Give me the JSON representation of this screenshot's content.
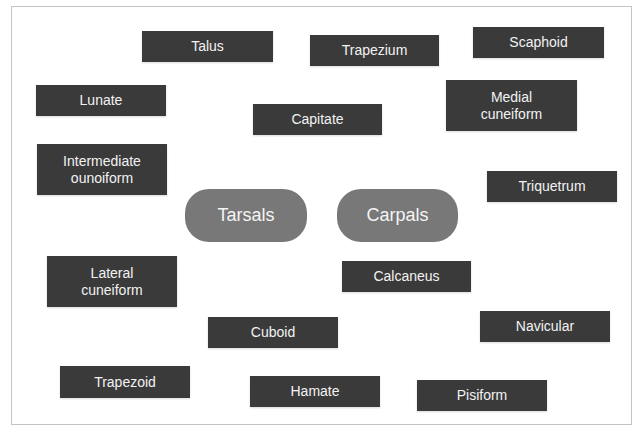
{
  "diagram": {
    "categories": [
      {
        "id": "tarsals",
        "label": "Tarsals",
        "x": 185,
        "y": 189,
        "w": 122,
        "h": 53
      },
      {
        "id": "carpals",
        "label": "Carpals",
        "x": 337,
        "y": 189,
        "w": 121,
        "h": 53
      }
    ],
    "terms": [
      {
        "label": "Talus",
        "x": 142,
        "y": 31,
        "w": 131,
        "h": 31
      },
      {
        "label": "Trapezium",
        "x": 310,
        "y": 35,
        "w": 129,
        "h": 31
      },
      {
        "label": "Scaphoid",
        "x": 473,
        "y": 27,
        "w": 131,
        "h": 31
      },
      {
        "label": "Lunate",
        "x": 36,
        "y": 85,
        "w": 130,
        "h": 31
      },
      {
        "label": "Capitate",
        "x": 253,
        "y": 104,
        "w": 129,
        "h": 31
      },
      {
        "label": "Medial cuneiform",
        "x": 446,
        "y": 80,
        "w": 131,
        "h": 51
      },
      {
        "label": "Intermediate ounoiform",
        "x": 37,
        "y": 144,
        "w": 130,
        "h": 51
      },
      {
        "label": "Triquetrum",
        "x": 487,
        "y": 171,
        "w": 130,
        "h": 31
      },
      {
        "label": "Lateral cuneiform",
        "x": 47,
        "y": 256,
        "w": 130,
        "h": 51
      },
      {
        "label": "Calcaneus",
        "x": 342,
        "y": 261,
        "w": 129,
        "h": 31
      },
      {
        "label": "Cuboid",
        "x": 208,
        "y": 317,
        "w": 130,
        "h": 31
      },
      {
        "label": "Navicular",
        "x": 480,
        "y": 311,
        "w": 130,
        "h": 31
      },
      {
        "label": "Trapezoid",
        "x": 60,
        "y": 366,
        "w": 130,
        "h": 32
      },
      {
        "label": "Hamate",
        "x": 250,
        "y": 376,
        "w": 130,
        "h": 31
      },
      {
        "label": "Pisiform",
        "x": 417,
        "y": 380,
        "w": 130,
        "h": 31
      }
    ]
  },
  "colors": {
    "term_box": "#3a3a3a",
    "term_text": "#f2f2f2",
    "category_pill": "#787878",
    "frame_border": "#c4c4c4"
  }
}
